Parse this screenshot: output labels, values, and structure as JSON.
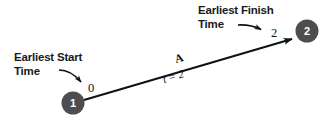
{
  "diagram": {
    "background_color": "#ffffff",
    "node_fill_color": "#4d4d4d",
    "node_text_color": "#ffffff",
    "line_color": "#111111",
    "annotations": [
      {
        "id": "earliest-start",
        "line1": "Earliest Start",
        "line2": "Time",
        "points_to_value": "0"
      },
      {
        "id": "earliest-finish",
        "line1": "Earliest Finish",
        "line2": "Time",
        "points_to_value": "2"
      }
    ],
    "nodes": [
      {
        "id": "node-1",
        "label": "1",
        "value_label": "0"
      },
      {
        "id": "node-2",
        "label": "2",
        "value_label": "2"
      }
    ],
    "edge": {
      "id": "edge-A",
      "activity_label": "A",
      "duration_label": "t = 2",
      "from": "1",
      "to": "2"
    }
  }
}
